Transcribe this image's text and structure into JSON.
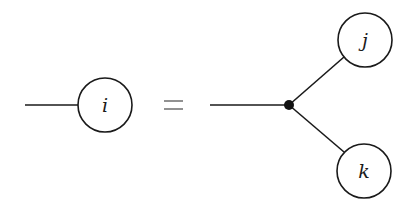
{
  "diagram": {
    "type": "tensor-network-identity",
    "lhs": {
      "node": {
        "label": "i",
        "cx": 105,
        "cy": 105,
        "r": 27
      },
      "leg": {
        "x1": 25,
        "y1": 105,
        "x2": 78,
        "y2": 105
      }
    },
    "operator": {
      "symbol": "=",
      "x1": 164,
      "x2": 183,
      "y_top": 101,
      "y_bottom": 109
    },
    "rhs": {
      "incoming_leg": {
        "x1": 210,
        "y1": 105,
        "x2": 289,
        "y2": 105
      },
      "junction": {
        "cx": 289,
        "cy": 105,
        "r": 5
      },
      "nodes": [
        {
          "label": "j",
          "cx": 365,
          "cy": 40,
          "r": 27
        },
        {
          "label": "k",
          "cx": 364,
          "cy": 171,
          "r": 27
        }
      ],
      "branches": [
        {
          "x1": 289,
          "y1": 105,
          "x2": 344,
          "y2": 57
        },
        {
          "x1": 289,
          "y1": 105,
          "x2": 344,
          "y2": 152
        }
      ]
    },
    "colors": {
      "stroke": "#1a1a1a",
      "background": "#ffffff"
    }
  }
}
